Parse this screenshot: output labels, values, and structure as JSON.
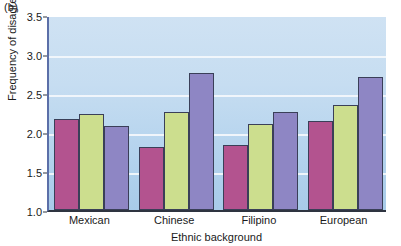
{
  "panel": {
    "label": "(b)"
  },
  "chart_data": {
    "type": "bar",
    "title": "",
    "subtitle": "",
    "xlabel": "Ethnic background",
    "ylabel": "Frequency of disagreement",
    "categories": [
      "Mexican",
      "Chinese",
      "Filipino",
      "European"
    ],
    "series": [
      {
        "name": "series-1",
        "color": "#b3538f",
        "values": [
          2.17,
          1.81,
          1.83,
          2.14
        ]
      },
      {
        "name": "series-2",
        "color": "#ccde8e",
        "values": [
          2.23,
          2.26,
          2.1,
          2.35
        ]
      },
      {
        "name": "series-3",
        "color": "#8e86c4",
        "values": [
          2.08,
          2.76,
          2.26,
          2.71
        ]
      }
    ],
    "ylim": [
      1.0,
      3.5
    ],
    "yticks": [
      1.0,
      1.5,
      2.0,
      2.5,
      3.0,
      3.5
    ],
    "ytick_labels": [
      "1.0",
      "1.5",
      "2.0",
      "2.5",
      "3.0",
      "3.5"
    ],
    "grid": true,
    "gridlines_at": [
      1.5,
      2.0,
      2.5,
      3.0
    ],
    "legend": "none",
    "legend_position": "none",
    "plot_background": "#c2dcf0",
    "gridline_color": "#f2f7fb",
    "axis_color": "#2e3440",
    "bar_edge_color": "#3a3f58"
  }
}
